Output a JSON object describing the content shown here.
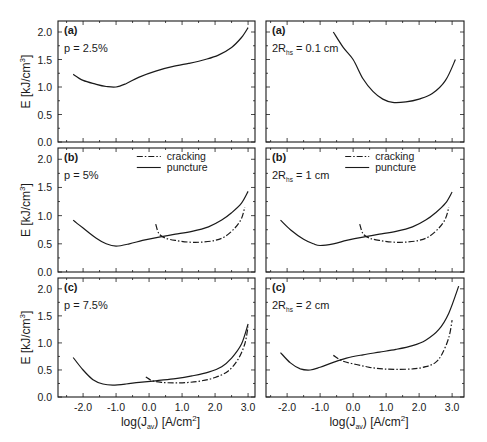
{
  "chart_data": {
    "type": "line",
    "layout": {
      "rows": 3,
      "cols": 2,
      "shared_x": true,
      "grid": false,
      "legend_position": "upper center (row b)"
    },
    "xlabel": "log(J_av) [A/cm^2]",
    "ylabel": "E [kJ/cm^3]",
    "x_ticks": [
      "-2.0",
      "-1.0",
      "0.0",
      "1.0",
      "2.0",
      "3.0"
    ],
    "y_ticks": [
      "0.0",
      "0.5",
      "1.0",
      "1.5",
      "2.0"
    ],
    "ylim": [
      0,
      2.2
    ],
    "legend": [
      {
        "name": "cracking",
        "style": "dash-dot"
      },
      {
        "name": "puncture",
        "style": "solid"
      }
    ],
    "panels": [
      {
        "id": "left-a",
        "col": 0,
        "row": 0,
        "label": "(a)",
        "param": "p = 2.5%",
        "xlim": [
          -2.76,
          3.21
        ],
        "series": [
          {
            "name": "puncture",
            "style": "solid",
            "x": [
              -2.3,
              -2.0,
              -1.6,
              -1.3,
              -1.0,
              -0.7,
              -0.3,
              0.2,
              0.7,
              1.2,
              1.7,
              2.1,
              2.5,
              2.8,
              3.0
            ],
            "y": [
              1.23,
              1.12,
              1.05,
              1.01,
              1.0,
              1.06,
              1.18,
              1.29,
              1.37,
              1.43,
              1.5,
              1.58,
              1.72,
              1.9,
              2.08
            ]
          }
        ]
      },
      {
        "id": "right-a",
        "col": 1,
        "row": 0,
        "label": "(a)",
        "param_prefix": "2R",
        "param_sub": "hs",
        "param_suffix": " = 0.1 cm",
        "xlim": [
          -2.64,
          3.36
        ],
        "series": [
          {
            "name": "puncture",
            "style": "solid",
            "x": [
              -0.6,
              -0.3,
              0.0,
              0.3,
              0.6,
              0.9,
              1.2,
              1.6,
              2.0,
              2.4,
              2.8,
              3.1
            ],
            "y": [
              2.0,
              1.72,
              1.5,
              1.15,
              0.92,
              0.78,
              0.72,
              0.73,
              0.78,
              0.88,
              1.12,
              1.5
            ]
          }
        ]
      },
      {
        "id": "left-b",
        "col": 0,
        "row": 1,
        "label": "(b)",
        "param": "p = 5%",
        "xlim": [
          -2.76,
          3.21
        ],
        "show_legend": true,
        "series": [
          {
            "name": "puncture",
            "style": "solid",
            "x": [
              -2.3,
              -2.0,
              -1.6,
              -1.3,
              -1.0,
              -0.6,
              -0.2,
              0.3,
              0.8,
              1.3,
              1.8,
              2.2,
              2.5,
              2.8,
              3.0
            ],
            "y": [
              0.92,
              0.78,
              0.6,
              0.5,
              0.46,
              0.5,
              0.56,
              0.62,
              0.67,
              0.72,
              0.8,
              0.92,
              1.05,
              1.22,
              1.43
            ]
          },
          {
            "name": "cracking",
            "style": "dash-dot",
            "x": [
              0.2,
              0.3,
              0.5,
              0.8,
              1.2,
              1.6,
              2.0,
              2.3,
              2.6,
              2.8,
              2.9
            ],
            "y": [
              0.85,
              0.68,
              0.6,
              0.56,
              0.53,
              0.53,
              0.56,
              0.63,
              0.78,
              0.95,
              1.15
            ]
          }
        ]
      },
      {
        "id": "right-b",
        "col": 1,
        "row": 1,
        "label": "(b)",
        "param_prefix": "2R",
        "param_sub": "hs",
        "param_suffix": " = 1 cm",
        "xlim": [
          -2.64,
          3.36
        ],
        "show_legend": true,
        "series": [
          {
            "name": "puncture",
            "style": "solid",
            "x": [
              -2.2,
              -1.9,
              -1.5,
              -1.2,
              -1.0,
              -0.6,
              -0.2,
              0.3,
              0.8,
              1.3,
              1.8,
              2.2,
              2.5,
              2.8,
              3.0
            ],
            "y": [
              0.92,
              0.75,
              0.58,
              0.5,
              0.47,
              0.5,
              0.56,
              0.62,
              0.67,
              0.72,
              0.8,
              0.92,
              1.05,
              1.22,
              1.42
            ]
          },
          {
            "name": "cracking",
            "style": "dash-dot",
            "x": [
              0.2,
              0.3,
              0.5,
              0.8,
              1.2,
              1.6,
              2.0,
              2.3,
              2.6,
              2.8,
              2.9
            ],
            "y": [
              0.85,
              0.68,
              0.6,
              0.56,
              0.53,
              0.53,
              0.56,
              0.63,
              0.78,
              0.95,
              1.15
            ]
          }
        ]
      },
      {
        "id": "left-c",
        "col": 0,
        "row": 2,
        "label": "(c)",
        "param": "p = 7.5%",
        "xlim": [
          -2.76,
          3.21
        ],
        "series": [
          {
            "name": "puncture",
            "style": "solid",
            "x": [
              -2.3,
              -2.0,
              -1.7,
              -1.4,
              -1.1,
              -0.7,
              -0.3,
              0.2,
              0.8,
              1.3,
              1.8,
              2.2,
              2.5,
              2.8,
              3.0
            ],
            "y": [
              0.73,
              0.5,
              0.32,
              0.24,
              0.22,
              0.24,
              0.27,
              0.3,
              0.34,
              0.39,
              0.46,
              0.56,
              0.72,
              0.98,
              1.35
            ]
          },
          {
            "name": "cracking",
            "style": "dash-dot",
            "x": [
              -0.1,
              0.1,
              0.4,
              0.8,
              1.2,
              1.6,
              2.0,
              2.4,
              2.7,
              2.9,
              3.0
            ],
            "y": [
              0.37,
              0.3,
              0.27,
              0.26,
              0.27,
              0.3,
              0.36,
              0.48,
              0.7,
              0.98,
              1.3
            ]
          }
        ]
      },
      {
        "id": "right-c",
        "col": 1,
        "row": 2,
        "label": "(c)",
        "param_prefix": "2R",
        "param_sub": "hs",
        "param_suffix": " = 2 cm",
        "xlim": [
          -2.64,
          3.36
        ],
        "series": [
          {
            "name": "puncture",
            "style": "solid",
            "x": [
              -2.2,
              -1.9,
              -1.6,
              -1.3,
              -1.0,
              -0.6,
              -0.2,
              0.3,
              0.8,
              1.3,
              1.8,
              2.2,
              2.6,
              2.9,
              3.2
            ],
            "y": [
              0.82,
              0.63,
              0.52,
              0.5,
              0.55,
              0.64,
              0.72,
              0.78,
              0.83,
              0.88,
              0.95,
              1.05,
              1.25,
              1.55,
              2.05
            ]
          },
          {
            "name": "cracking",
            "style": "dash-dot",
            "x": [
              -0.6,
              -0.3,
              0.1,
              0.5,
              0.9,
              1.3,
              1.8,
              2.2,
              2.5,
              2.7,
              2.9,
              3.0
            ],
            "y": [
              0.77,
              0.66,
              0.6,
              0.55,
              0.52,
              0.51,
              0.52,
              0.56,
              0.64,
              0.8,
              1.1,
              1.42
            ]
          }
        ]
      }
    ]
  },
  "geometry": {
    "cols": [
      {
        "x0": 58,
        "x1": 255
      },
      {
        "x0": 266,
        "x1": 464
      }
    ],
    "rows": [
      {
        "y0": 21,
        "y1": 142
      },
      {
        "y0": 148,
        "y1": 272
      },
      {
        "y0": 278,
        "y1": 397
      }
    ]
  }
}
